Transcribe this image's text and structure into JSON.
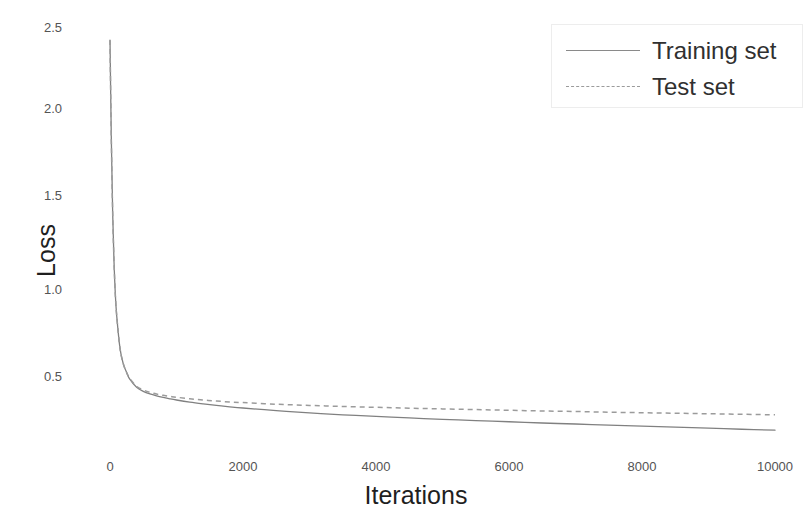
{
  "chart_data": {
    "type": "line",
    "title": "",
    "xlabel": "Iterations",
    "ylabel": "Loss",
    "xlim": [
      -200,
      10200
    ],
    "ylim": [
      0.12,
      2.62
    ],
    "grid": false,
    "legend_position": "top-right",
    "xticks": [
      0,
      2000,
      4000,
      6000,
      8000,
      10000
    ],
    "xtick_labels": [
      "0",
      "2000",
      "4000",
      "6000",
      "8000",
      "10000"
    ],
    "yticks": [
      0.5,
      1.0,
      1.5,
      2.0,
      2.5
    ],
    "ytick_labels": [
      "0.5",
      "1.0",
      "1.5",
      "2.0",
      "2.5"
    ],
    "x": [
      0,
      20,
      40,
      60,
      80,
      100,
      150,
      200,
      250,
      300,
      400,
      500,
      600,
      700,
      800,
      900,
      1000,
      1200,
      1400,
      1600,
      1800,
      2000,
      2500,
      3000,
      3500,
      4000,
      4500,
      5000,
      5500,
      6000,
      6500,
      7000,
      7500,
      8000,
      8500,
      9000,
      9500,
      10000
    ],
    "series": [
      {
        "name": "Training set",
        "style": "solid",
        "color": "#808080",
        "values": [
          2.43,
          1.86,
          1.44,
          1.16,
          0.97,
          0.85,
          0.66,
          0.57,
          0.52,
          0.48,
          0.435,
          0.412,
          0.397,
          0.386,
          0.377,
          0.369,
          0.362,
          0.35,
          0.34,
          0.331,
          0.323,
          0.316,
          0.301,
          0.288,
          0.277,
          0.268,
          0.259,
          0.251,
          0.244,
          0.237,
          0.23,
          0.224,
          0.218,
          0.212,
          0.206,
          0.2,
          0.194,
          0.189
        ]
      },
      {
        "name": "Test set",
        "style": "dashed",
        "color": "#9b9b9b",
        "values": [
          2.43,
          1.86,
          1.44,
          1.16,
          0.97,
          0.85,
          0.66,
          0.57,
          0.52,
          0.485,
          0.441,
          0.42,
          0.406,
          0.396,
          0.389,
          0.383,
          0.378,
          0.369,
          0.362,
          0.356,
          0.351,
          0.347,
          0.338,
          0.331,
          0.325,
          0.32,
          0.315,
          0.311,
          0.307,
          0.303,
          0.299,
          0.296,
          0.292,
          0.289,
          0.286,
          0.283,
          0.28,
          0.277
        ]
      }
    ],
    "legend": [
      {
        "label": "Training set",
        "style": "solid",
        "color": "#808080"
      },
      {
        "label": "Test set",
        "style": "dashed",
        "color": "#9b9b9b"
      }
    ]
  },
  "axes": {
    "ylabel": "Loss",
    "xlabel": "Iterations",
    "ytick_labels": [
      "2.5",
      "2.0",
      "1.5",
      "1.0",
      "0.5"
    ],
    "xtick_labels": [
      "0",
      "2000",
      "4000",
      "6000",
      "8000",
      "10000"
    ]
  }
}
